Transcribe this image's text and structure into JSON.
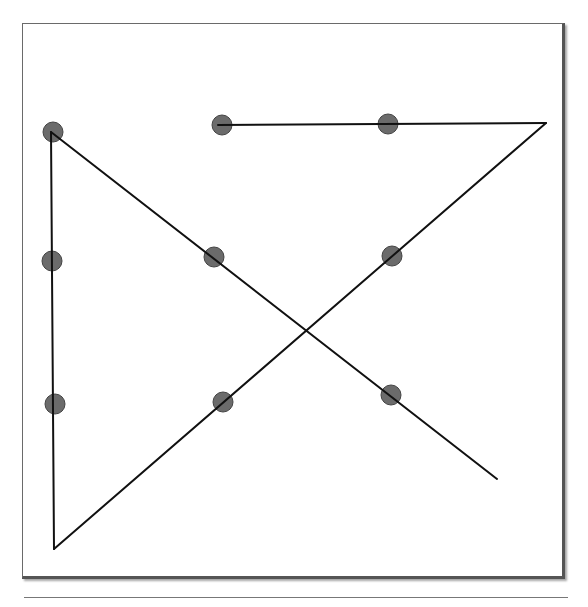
{
  "figure": {
    "line_color": "#111111",
    "dot_fill": "#6b6b6b",
    "dot_stroke": "#444444",
    "frame_color": "#6a6a6a",
    "grid": {
      "rows": 3,
      "cols": 3
    },
    "dots": [
      {
        "row": 0,
        "col": 0
      },
      {
        "row": 0,
        "col": 1
      },
      {
        "row": 0,
        "col": 2
      },
      {
        "row": 1,
        "col": 0
      },
      {
        "row": 1,
        "col": 1
      },
      {
        "row": 1,
        "col": 2
      },
      {
        "row": 2,
        "col": 0
      },
      {
        "row": 2,
        "col": 1
      },
      {
        "row": 2,
        "col": 2
      }
    ],
    "path_segments": 4
  },
  "caption": {
    "text": ""
  }
}
